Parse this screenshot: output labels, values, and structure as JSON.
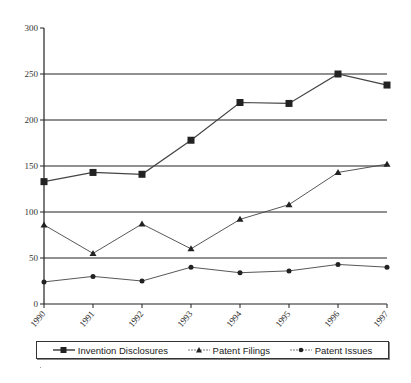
{
  "chart_data": {
    "type": "line",
    "title": "",
    "xlabel": "",
    "ylabel": "",
    "x": [
      "1990",
      "1991",
      "1992",
      "1993",
      "1994",
      "1995",
      "1996",
      "1997"
    ],
    "ylim": [
      0,
      300
    ],
    "yticks": [
      "0",
      "50",
      "100",
      "150",
      "200",
      "250",
      "300"
    ],
    "grid": "horizontal",
    "legend_position": "bottom",
    "series": [
      {
        "name": "Invention Disclosures",
        "marker": "square",
        "values": [
          133,
          143,
          141,
          178,
          219,
          218,
          250,
          238
        ]
      },
      {
        "name": "Patent Filings",
        "marker": "triangle",
        "values": [
          86,
          55,
          87,
          60,
          92,
          108,
          143,
          152
        ]
      },
      {
        "name": "Patent Issues",
        "marker": "circle",
        "values": [
          24,
          30,
          25,
          40,
          34,
          36,
          43,
          40
        ]
      }
    ]
  },
  "legend": {
    "items": [
      {
        "label": "Invention Disclosures"
      },
      {
        "label": "Patent Filings"
      },
      {
        "label": "Patent Issues"
      }
    ]
  },
  "colors": {
    "line": "#333333",
    "grid": "#222222",
    "marker": "#222222"
  }
}
